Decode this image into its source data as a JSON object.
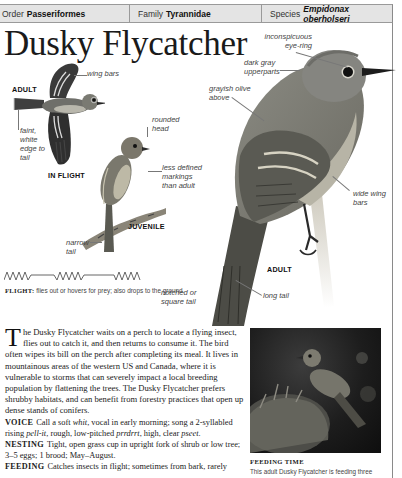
{
  "header": {
    "order_label": "Order",
    "order_value": "Passeriformes",
    "family_label": "Family",
    "family_value": "Tyrannidae",
    "species_label": "Species",
    "species_value": "Empidonax oberholseri"
  },
  "title": "Dusky Flycatcher",
  "illustrations": {
    "in_flight": {
      "stage_label": "ADULT",
      "caption": "IN FLIGHT",
      "annotations": [
        "wing bars",
        "faint, white edge to tail"
      ]
    },
    "juvenile": {
      "stage_label": "JUVENILE",
      "annotations": [
        "rounded head",
        "less defined markings than adult",
        "narrow tail"
      ]
    },
    "adult": {
      "stage_label": "ADULT",
      "annotations": [
        "inconspicuous eye-ring",
        "dark gray upperparts",
        "grayish olive above",
        "wide wing bars",
        "notched or square tail",
        "long tail"
      ]
    }
  },
  "flight": {
    "label": "FLIGHT:",
    "text": "flies out or hovers for prey; also drops to the ground."
  },
  "body": {
    "drop_cap": "T",
    "intro": "he Dusky Flycatcher waits on a perch to locate a flying insect, flies out to catch it, and then returns to consume it. The bird often wipes its bill on the perch after completing its meal. It lives in mountainous areas of the western US and Canada, where it is vulnerable to storms that can severely impact a local breeding population by flattening the trees. The Dusky Flycatcher prefers shrubby habitats, and can benefit from forestry practices that open up dense stands of conifers.",
    "voice": {
      "heading": "VOICE",
      "t1": "Call a soft ",
      "i1": "whit",
      "t2": ", vocal in early morning; song a 2-syllabled rising ",
      "i2": "pell-it",
      "t3": ", rough, low-pitched ",
      "i3": "prrdrrt",
      "t4": ", high, clear ",
      "i4": "pseet",
      "t5": "."
    },
    "nesting": {
      "heading": "NESTING",
      "text": "Tight, open grass cup in upright fork of shrub or low tree; 3–5 eggs; 1 brood; May–August."
    },
    "feeding": {
      "heading": "FEEDING",
      "text": "Catches insects in flight; sometimes from bark, rarely"
    }
  },
  "photo": {
    "caption_title": "FEEDING TIME",
    "caption_text": "This adult Dusky Flycatcher is feeding three"
  }
}
